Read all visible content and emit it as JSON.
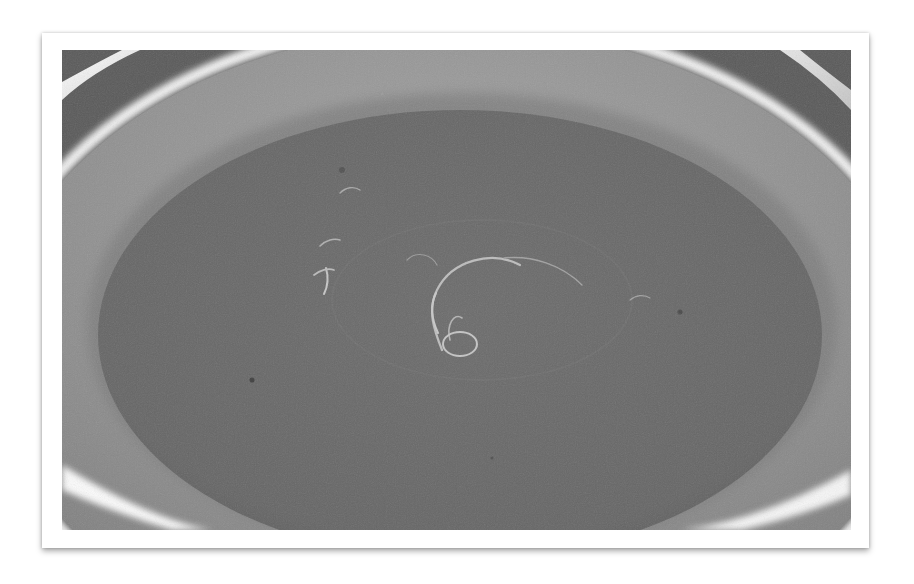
{
  "image": {
    "alt": "Grayscale photo of a bowl of smooth soup with a swirl of oil on the surface",
    "subject": "bowl of soup",
    "colors": {
      "frame": "#ffffff",
      "bowl_wall": "#8c8c8c",
      "bowl_rim_highlight": "#f4f4f4",
      "soup_surface": "#6a6a6a",
      "oil_highlight": "#c8c8c8",
      "background_table": "#5e5e5e"
    }
  }
}
